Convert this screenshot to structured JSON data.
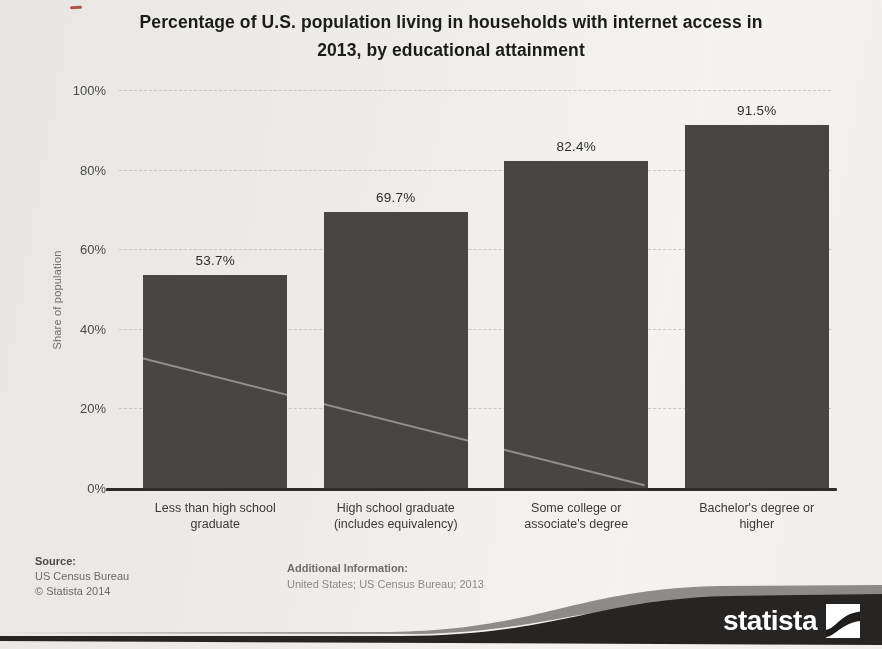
{
  "chart_data": {
    "type": "bar",
    "title": "Percentage of U.S. population living in households with internet access in\n2013, by educational attainment",
    "categories": [
      "Less than high school\ngraduate",
      "High school graduate\n(includes equivalency)",
      "Some college or\nassociate's degree",
      "Bachelor's degree or\nhigher"
    ],
    "values": [
      53.7,
      69.7,
      82.4,
      91.5
    ],
    "value_labels": [
      "53.7%",
      "69.7%",
      "82.4%",
      "91.5%"
    ],
    "xlabel": "",
    "ylabel": "Share of population",
    "ylim": [
      0,
      100
    ],
    "yticks": [
      "0%",
      "20%",
      "40%",
      "60%",
      "80%",
      "100%"
    ],
    "grid": "horizontal-dashed",
    "legend": "none",
    "bar_color": "#474645"
  },
  "footer": {
    "source_heading": "Source:",
    "source_lines": [
      "US Census Bureau",
      "© Statista 2014"
    ],
    "additional_heading": "Additional Information:",
    "additional_text": "United States; US Census Bureau; 2013"
  },
  "branding": {
    "logo_text": "statista"
  },
  "colors": {
    "background": "#edecE9",
    "bar": "#474645",
    "band_dark": "#262524",
    "band_gray": "#8d8b88",
    "gridline": "#c9c6c0",
    "title_text": "#1b1b1b",
    "logo_text_color": "#ffffff"
  }
}
